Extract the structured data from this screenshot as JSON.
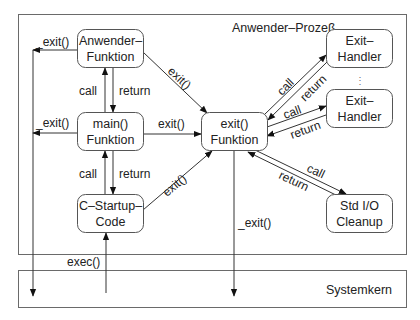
{
  "diagram": {
    "process_title": "Anwender–Prozeß",
    "kernel_title": "Systemkern",
    "nodes": {
      "anwender": {
        "line1": "Anwender–",
        "line2": "Funktion"
      },
      "main": {
        "line1": "main()",
        "line2": "Funktion"
      },
      "startup": {
        "line1": "C–Startup–",
        "line2": "Code"
      },
      "exitfn": {
        "line1": "exit()",
        "line2": "Funktion"
      },
      "handler1": {
        "line1": "Exit–",
        "line2": "Handler"
      },
      "handler2": {
        "line1": "Exit–",
        "line2": "Handler"
      },
      "stdio": {
        "line1": "Std I/O",
        "line2": "Cleanup"
      }
    },
    "ellipsis": "⋮",
    "edges": {
      "anwender_exit_underscore": "_exit()",
      "main_exit_underscore": "_exit()",
      "exitfn_exit_underscore": "_exit()",
      "anwender_exit": "exit()",
      "main_exit": "exit()",
      "startup_exit": "exit()",
      "main_anwender_call": "call",
      "main_anwender_return": "return",
      "startup_main_call": "call",
      "startup_main_return": "return",
      "h1_call": "call",
      "h1_return": "return",
      "h2_call": "call",
      "h2_return": "return",
      "stdio_call": "call",
      "stdio_return": "return",
      "exec": "exec()"
    }
  }
}
